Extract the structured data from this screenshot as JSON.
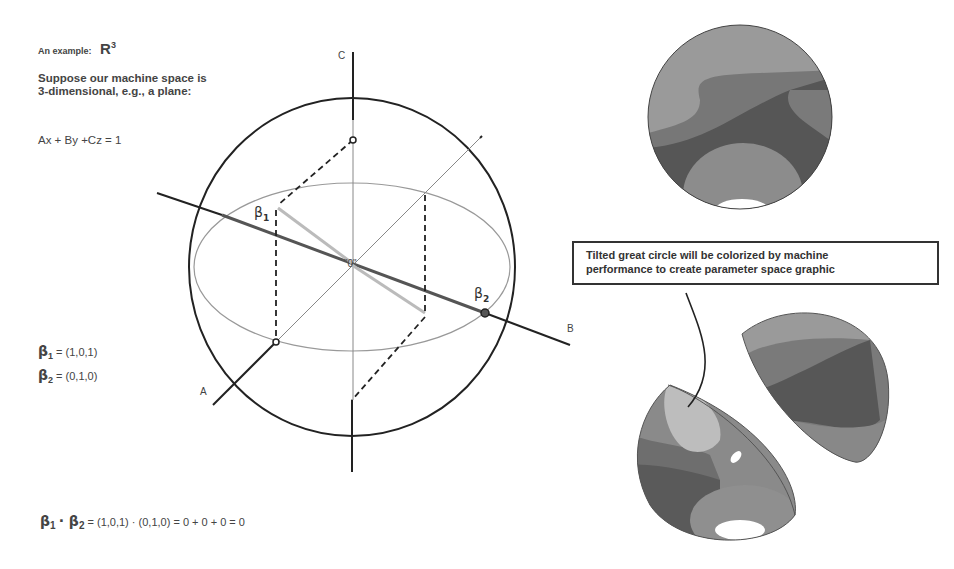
{
  "left_panel": {
    "title_prefix": "An example:",
    "title_space": "R",
    "title_exponent": "3",
    "description": "Suppose our machine space is 3-dimensional, e.g., a plane:",
    "plane_equation": "Ax + By +Cz = 1",
    "beta1_symbol": "β",
    "beta1_sub": "1",
    "beta1_value": "= (1,0,1)",
    "beta2_symbol": "β",
    "beta2_sub": "2",
    "beta2_value": "= (0,1,0)",
    "dot_product": {
      "b1": "β",
      "b1_sub": "1",
      "dot": " · ",
      "b2": "β",
      "b2_sub": "2",
      "rhs": "=  (1,0,1) · (0,1,0) = 0 + 0 + 0 = 0"
    }
  },
  "sphere_diagram": {
    "axis_labels": {
      "a": "A",
      "b": "B",
      "c": "C"
    },
    "origin_label": "\"0\"",
    "beta1_label": "β",
    "beta1_sub": "1",
    "beta2_label": "β",
    "beta2_sub": "2"
  },
  "callout": {
    "line1": "Tilted great circle will be colorized by machine",
    "line2": "performance to create parameter space graphic"
  },
  "colors": {
    "ink": "#222222",
    "light_line": "#9a9a9a",
    "beta1_line": "#bdbdbd",
    "shade_light": "#a8a8a8",
    "shade_mid": "#8a8a8a",
    "shade_dark": "#5e5e5e",
    "shade_lightest": "#c4c4c4"
  }
}
